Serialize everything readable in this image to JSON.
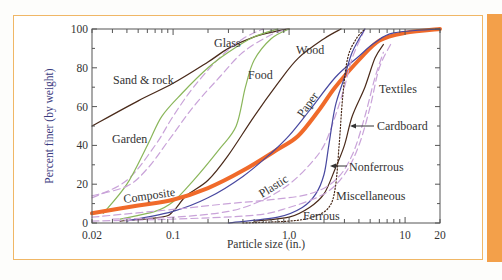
{
  "chart_data": {
    "type": "line",
    "title": "",
    "xlabel": "Particle size (in.)",
    "ylabel": "Percent finer (by weight)",
    "xscale": "log",
    "xlim": [
      0.02,
      20
    ],
    "ylim": [
      0,
      100
    ],
    "x_ticks": [
      {
        "value": 0.02,
        "label": "0.02"
      },
      {
        "value": 0.1,
        "label": "0.1"
      },
      {
        "value": 1.0,
        "label": "1.0"
      },
      {
        "value": 10,
        "label": "10"
      },
      {
        "value": 20,
        "label": "20"
      }
    ],
    "y_ticks": [
      {
        "value": 0,
        "label": "0"
      },
      {
        "value": 20,
        "label": "20"
      },
      {
        "value": 40,
        "label": "40"
      },
      {
        "value": 60,
        "label": "60"
      },
      {
        "value": 80,
        "label": "80"
      },
      {
        "value": 100,
        "label": "100"
      }
    ],
    "grid": false,
    "legend": "inline labels",
    "series": [
      {
        "name": "Sand & rock",
        "color": "#4a2a1a",
        "style": "solid",
        "width": 1.3,
        "points": [
          [
            0.02,
            50
          ],
          [
            0.05,
            63
          ],
          [
            0.1,
            72
          ],
          [
            0.2,
            83
          ],
          [
            0.3,
            90
          ],
          [
            0.5,
            96
          ],
          [
            0.8,
            99
          ],
          [
            1.0,
            100
          ]
        ]
      },
      {
        "name": "Glass",
        "color": "#c9a3d9",
        "style": "dashed",
        "width": 1.2,
        "points": [
          [
            0.02,
            13
          ],
          [
            0.04,
            22
          ],
          [
            0.07,
            40
          ],
          [
            0.1,
            55
          ],
          [
            0.15,
            70
          ],
          [
            0.25,
            85
          ],
          [
            0.4,
            95
          ],
          [
            0.6,
            100
          ]
        ]
      },
      {
        "name": "Garden",
        "color": "#8ab65a",
        "style": "solid",
        "width": 1.2,
        "points": [
          [
            0.025,
            5
          ],
          [
            0.04,
            20
          ],
          [
            0.06,
            40
          ],
          [
            0.08,
            55
          ],
          [
            0.12,
            67
          ],
          [
            0.2,
            80
          ],
          [
            0.3,
            88
          ],
          [
            0.5,
            96
          ],
          [
            0.8,
            100
          ]
        ]
      },
      {
        "name": "Garden (dashed)",
        "color": "#c9a3d9",
        "style": "dashed",
        "width": 1.2,
        "points": [
          [
            0.02,
            14
          ],
          [
            0.04,
            19
          ],
          [
            0.06,
            28
          ],
          [
            0.09,
            42
          ],
          [
            0.15,
            60
          ],
          [
            0.25,
            75
          ],
          [
            0.4,
            88
          ],
          [
            0.7,
            97
          ],
          [
            1.0,
            100
          ]
        ]
      },
      {
        "name": "Food",
        "color": "#8ab65a",
        "style": "solid",
        "width": 1.2,
        "points": [
          [
            0.035,
            2
          ],
          [
            0.07,
            6
          ],
          [
            0.1,
            11
          ],
          [
            0.15,
            22
          ],
          [
            0.25,
            38
          ],
          [
            0.35,
            50
          ],
          [
            0.42,
            70
          ],
          [
            0.5,
            84
          ],
          [
            0.7,
            95
          ],
          [
            1.0,
            100
          ]
        ]
      },
      {
        "name": "Wood",
        "color": "#4a2a1a",
        "style": "solid",
        "width": 1.2,
        "points": [
          [
            0.035,
            1
          ],
          [
            0.08,
            3
          ],
          [
            0.1,
            6
          ],
          [
            0.13,
            14
          ],
          [
            0.2,
            22
          ],
          [
            0.3,
            35
          ],
          [
            0.5,
            55
          ],
          [
            0.8,
            72
          ],
          [
            1.2,
            85
          ],
          [
            2.0,
            95
          ],
          [
            2.8,
            100
          ]
        ]
      },
      {
        "name": "Composite",
        "color": "#f06a2a",
        "style": "solid",
        "width": 4,
        "points": [
          [
            0.02,
            5
          ],
          [
            0.05,
            9
          ],
          [
            0.1,
            12
          ],
          [
            0.2,
            18
          ],
          [
            0.4,
            27
          ],
          [
            0.8,
            38
          ],
          [
            1.2,
            45
          ],
          [
            1.8,
            58
          ],
          [
            2.5,
            70
          ],
          [
            4,
            84
          ],
          [
            6,
            94
          ],
          [
            10,
            98
          ],
          [
            20,
            100
          ]
        ]
      },
      {
        "name": "Paper",
        "color": "#4848a0",
        "style": "solid",
        "width": 1.2,
        "points": [
          [
            0.04,
            1
          ],
          [
            0.1,
            6
          ],
          [
            0.2,
            13
          ],
          [
            0.4,
            24
          ],
          [
            0.7,
            36
          ],
          [
            1.0,
            45
          ],
          [
            1.5,
            58
          ],
          [
            2.5,
            75
          ],
          [
            4,
            86
          ],
          [
            5.5,
            93
          ],
          [
            8,
            98
          ],
          [
            20,
            100
          ]
        ]
      },
      {
        "name": "Plastic",
        "color": "#c9a3d9",
        "style": "dashed",
        "width": 1.2,
        "points": [
          [
            0.03,
            2
          ],
          [
            0.1,
            3
          ],
          [
            0.3,
            6
          ],
          [
            0.6,
            12
          ],
          [
            1.0,
            20
          ],
          [
            1.5,
            30
          ],
          [
            2.0,
            40
          ],
          [
            2.5,
            55
          ],
          [
            3.0,
            70
          ],
          [
            3.5,
            85
          ],
          [
            4.5,
            100
          ]
        ]
      },
      {
        "name": "Cardboard",
        "color": "#4a2a1a",
        "style": "solid",
        "width": 1.2,
        "points": [
          [
            0.5,
            1
          ],
          [
            1.0,
            3
          ],
          [
            1.5,
            8
          ],
          [
            2.0,
            15
          ],
          [
            2.5,
            28
          ],
          [
            3.0,
            40
          ],
          [
            3.5,
            55
          ],
          [
            4.5,
            70
          ],
          [
            5.5,
            85
          ],
          [
            6.5,
            92
          ]
        ]
      },
      {
        "name": "Nonferrous",
        "color": "#4848a0",
        "style": "solid",
        "width": 1.2,
        "points": [
          [
            0.3,
            0
          ],
          [
            0.8,
            3
          ],
          [
            1.3,
            8
          ],
          [
            1.7,
            15
          ],
          [
            2.0,
            25
          ],
          [
            2.2,
            40
          ],
          [
            2.5,
            60
          ],
          [
            3.0,
            75
          ],
          [
            3.5,
            88
          ],
          [
            4.5,
            100
          ]
        ]
      },
      {
        "name": "Ferrous",
        "color": "#4a2a1a",
        "style": "dotted",
        "width": 1.2,
        "points": [
          [
            0.4,
            0
          ],
          [
            1.0,
            1
          ],
          [
            1.6,
            3
          ],
          [
            2.2,
            8
          ],
          [
            2.5,
            18
          ],
          [
            2.7,
            40
          ],
          [
            2.9,
            65
          ],
          [
            3.2,
            85
          ],
          [
            3.8,
            95
          ],
          [
            4.5,
            100
          ]
        ]
      },
      {
        "name": "Miscellaneous",
        "color": "#c9a3d9",
        "style": "dashed",
        "width": 1.2,
        "points": [
          [
            0.02,
            1
          ],
          [
            0.1,
            2
          ],
          [
            0.5,
            4
          ],
          [
            1.0,
            8
          ],
          [
            2.0,
            15
          ],
          [
            3.0,
            25
          ],
          [
            4.0,
            40
          ],
          [
            5.0,
            60
          ],
          [
            6.0,
            80
          ],
          [
            7.5,
            92
          ]
        ]
      },
      {
        "name": "Textiles",
        "color": "#c9a3d9",
        "style": "dashed",
        "width": 1.2,
        "points": [
          [
            0.02,
            3
          ],
          [
            0.1,
            7
          ],
          [
            0.3,
            10
          ],
          [
            0.7,
            12
          ],
          [
            1.5,
            15
          ],
          [
            2.5,
            22
          ],
          [
            3.5,
            35
          ],
          [
            4.5,
            55
          ],
          [
            5.5,
            75
          ],
          [
            6.5,
            88
          ]
        ]
      }
    ],
    "annotations": [
      {
        "text": "Sand & rock",
        "x": 113,
        "y": 84
      },
      {
        "text": "Glass",
        "x": 214,
        "y": 47
      },
      {
        "text": "Garden",
        "x": 112,
        "y": 143
      },
      {
        "text": "Food",
        "x": 248,
        "y": 79
      },
      {
        "text": "Wood",
        "x": 296,
        "y": 54
      },
      {
        "text": "Composite",
        "x": 124,
        "y": 203,
        "rotate": -8
      },
      {
        "text": "Paper",
        "x": 303,
        "y": 118,
        "rotate": -55
      },
      {
        "text": "Plastic",
        "x": 262,
        "y": 198,
        "rotate": -32
      },
      {
        "text": "Textiles",
        "x": 379,
        "y": 93
      },
      {
        "text": "Cardboard",
        "x": 377,
        "y": 130
      },
      {
        "text": "Nonferrous",
        "x": 349,
        "y": 171
      },
      {
        "text": "Miscellaneous",
        "x": 336,
        "y": 200
      },
      {
        "text": "Ferrous",
        "x": 303,
        "y": 220
      }
    ]
  },
  "labels": {
    "xlabel": "Particle size (in.)",
    "ylabel": "Percent finer (by weight)"
  }
}
